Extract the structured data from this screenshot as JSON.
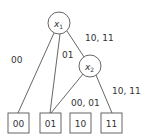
{
  "diagram": {
    "type": "decision-tree",
    "nodes": [
      {
        "id": "x1",
        "var": "x",
        "sub": "1"
      },
      {
        "id": "x2",
        "var": "x",
        "sub": "2"
      }
    ],
    "leaves": [
      {
        "id": "leaf-00",
        "label": "00"
      },
      {
        "id": "leaf-01",
        "label": "01"
      },
      {
        "id": "leaf-10",
        "label": "10"
      },
      {
        "id": "leaf-11",
        "label": "11"
      }
    ],
    "edges": [
      {
        "from": "x1",
        "to": "leaf-00",
        "label": "00"
      },
      {
        "from": "x1",
        "to": "leaf-01",
        "label": "01"
      },
      {
        "from": "x1",
        "to": "x2",
        "label": "10, 11"
      },
      {
        "from": "x2",
        "to": "leaf-01",
        "label": "00, 01"
      },
      {
        "from": "x2",
        "to": "leaf-11",
        "label": "10, 11"
      }
    ],
    "colors": {
      "stroke": "#555555",
      "text": "#333333",
      "background": "#ffffff"
    }
  }
}
